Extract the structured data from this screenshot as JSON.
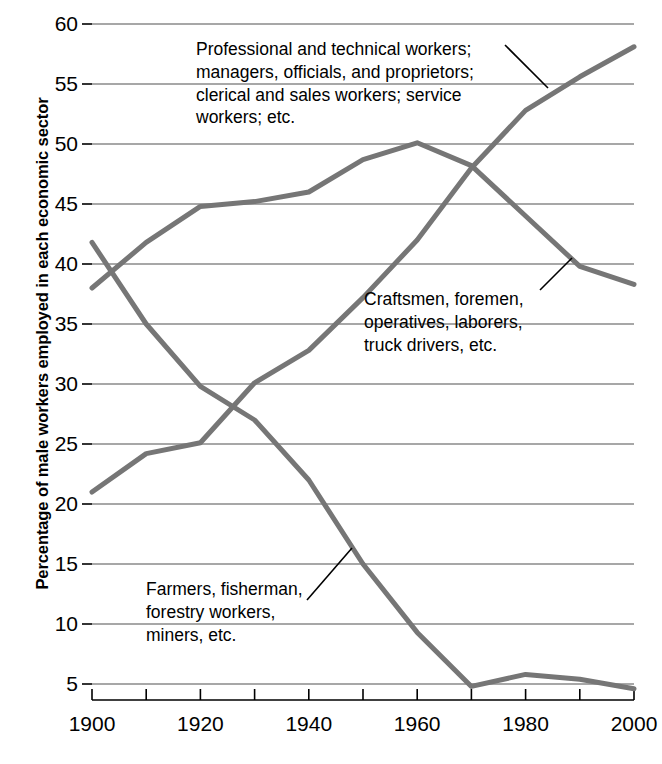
{
  "chart_data": {
    "type": "line",
    "title": "",
    "xlabel": "",
    "ylabel": "Percentage of male workers employed in each economic sector",
    "x": [
      1900,
      1910,
      1920,
      1930,
      1940,
      1950,
      1960,
      1970,
      1980,
      1990,
      2000
    ],
    "xlim": [
      1900,
      2000
    ],
    "ylim": [
      0,
      60
    ],
    "yticks": [
      5,
      10,
      15,
      20,
      25,
      30,
      35,
      40,
      45,
      50,
      55,
      60
    ],
    "xticks": [
      1900,
      1910,
      1920,
      1930,
      1940,
      1950,
      1960,
      1970,
      1980,
      1990,
      2000
    ],
    "xtick_labels_shown": [
      1900,
      1920,
      1940,
      1960,
      1980,
      2000
    ],
    "grid": "horizontal",
    "legend": "annotations",
    "line_color": "#767676",
    "series": [
      {
        "name": "Professional and technical workers; managers, officials, and proprietors; clerical and sales workers; service workers; etc.",
        "values": [
          38.0,
          41.8,
          44.8,
          45.2,
          46.0,
          48.7,
          50.1,
          48.2,
          44.0,
          39.8,
          38.3
        ]
      },
      {
        "name": "Craftsmen, foremen, operatives, laborers, truck drivers, etc.",
        "values": [
          21.0,
          24.2,
          25.1,
          30.1,
          32.8,
          37.2,
          42.0,
          48.0,
          52.8,
          55.6,
          58.1
        ]
      },
      {
        "name": "Farmers, fisherman, forestry workers, miners, etc.",
        "values": [
          41.8,
          35.0,
          29.8,
          27.0,
          22.0,
          15.0,
          9.3,
          4.8,
          5.8,
          5.4,
          4.6
        ]
      }
    ]
  },
  "axis": {
    "ytick_labels": [
      "60",
      "55",
      "50",
      "45",
      "40",
      "35",
      "30",
      "25",
      "20",
      "15",
      "10",
      "5"
    ],
    "xtick_labels": [
      "1900",
      "1920",
      "1940",
      "1960",
      "1980",
      "2000"
    ]
  },
  "annotations": {
    "professional": "Professional and technical workers;\nmanagers, officials, and proprietors;\nclerical and sales workers; service\nworkers; etc.",
    "craftsmen": "Craftsmen, foremen,\noperatives, laborers,\ntruck drivers, etc.",
    "farmers": "Farmers, fisherman,\nforestry workers,\nminers, etc."
  }
}
